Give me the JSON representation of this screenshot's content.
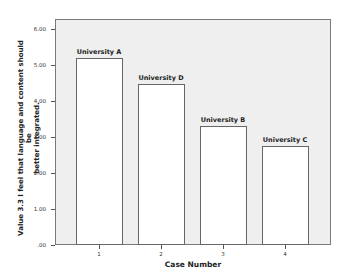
{
  "chart_data": {
    "type": "bar",
    "title": "",
    "xlabel": "Case Number",
    "ylabel": "Value 3.3 I feel that language and content should be better integrated.",
    "ylabel_lines": [
      "Value 3.3 I feel that language and content should be",
      "better integrated."
    ],
    "categories": [
      "1",
      "2",
      "3",
      "4"
    ],
    "bar_labels": [
      "University A",
      "University D",
      "University B",
      "University C"
    ],
    "values": [
      5.2,
      4.47,
      3.3,
      2.75
    ],
    "ylim": [
      0,
      6.2
    ],
    "yticks": [
      0,
      1,
      2,
      3,
      4,
      5,
      6
    ],
    "ytick_labels": [
      ".00",
      "1.00",
      "2.00",
      "3.00",
      "4.00",
      "5.00",
      "6.00"
    ],
    "grid": false,
    "legend": null,
    "colors": {
      "plot_bg": "#efefef",
      "bar_fill": "#ffffff",
      "bar_border": "#666666"
    }
  }
}
